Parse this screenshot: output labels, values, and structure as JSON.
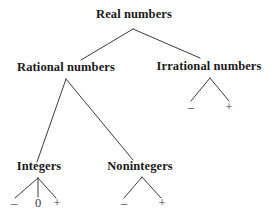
{
  "diagram": {
    "type": "tree",
    "background_color": "#ffffff",
    "line_color": "#3a3a3a",
    "text_color": "#1a1a1a",
    "sign_color": "#3a3a3a",
    "nodes": {
      "root": {
        "label": "Real numbers"
      },
      "rational": {
        "label": "Rational numbers"
      },
      "irrational": {
        "label": "Irrational numbers"
      },
      "integers": {
        "label": "Integers"
      },
      "nonintegers": {
        "label": "Nonintegers"
      }
    },
    "signs": {
      "irrational_minus": "–",
      "irrational_plus": "+",
      "integers_minus": "–",
      "integers_zero": "0",
      "integers_plus": "+",
      "nonintegers_minus": "–",
      "nonintegers_plus": "+"
    }
  }
}
